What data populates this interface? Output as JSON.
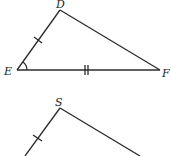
{
  "diagram": {
    "type": "geometry-triangles",
    "triangle_1": {
      "vertices": [
        {
          "label": "D",
          "x": 60,
          "y": 10
        },
        {
          "label": "E",
          "x": 17,
          "y": 70
        },
        {
          "label": "F",
          "x": 160,
          "y": 70
        }
      ],
      "marks": {
        "side_DE": "single-tick",
        "side_EF": "double-tick",
        "angle_E": "arc"
      }
    },
    "triangle_2": {
      "vertices": [
        {
          "label": "S",
          "x": 60,
          "y": 108
        }
      ],
      "marks": {
        "left_side": "single-tick"
      },
      "note": "partially visible"
    }
  },
  "labels": {
    "D": "D",
    "E": "E",
    "F": "F",
    "S": "S"
  }
}
